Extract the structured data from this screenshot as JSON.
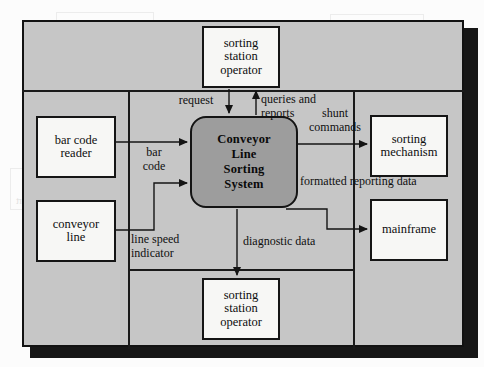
{
  "figure": {
    "type": "context-diagram",
    "process": {
      "id": "0",
      "label": "Conveyor\nLine\nSorting\nSystem",
      "shape": "rounded-rectangle",
      "fill": "#9d9d9d"
    },
    "entities": [
      {
        "key": "operator_top",
        "label": "sorting\nstation\noperator",
        "position": "top"
      },
      {
        "key": "bar_code_reader",
        "label": "bar code\nreader",
        "position": "left-upper"
      },
      {
        "key": "conveyor_line",
        "label": "conveyor\nline",
        "position": "left-lower"
      },
      {
        "key": "sorting_mechanism",
        "label": "sorting\nmechanism",
        "position": "right-upper"
      },
      {
        "key": "mainframe",
        "label": "mainframe",
        "position": "right-lower"
      },
      {
        "key": "operator_bottom",
        "label": "sorting\nstation\noperator",
        "position": "bottom"
      }
    ],
    "flows": [
      {
        "key": "request",
        "label": "request",
        "from": "operator_top",
        "to": "process",
        "direction": "down"
      },
      {
        "key": "queries",
        "label": "queries and\nreports",
        "from": "process",
        "to": "operator_top",
        "direction": "up"
      },
      {
        "key": "shunt",
        "label": "shunt\ncommands",
        "from": "process",
        "to": "sorting_mechanism",
        "direction": "right"
      },
      {
        "key": "barcode",
        "label": "bar\ncode",
        "from": "bar_code_reader",
        "to": "process",
        "direction": "right"
      },
      {
        "key": "linespeed",
        "label": "line speed\nindicator",
        "from": "conveyor_line",
        "to": "process",
        "direction": "right"
      },
      {
        "key": "formatted",
        "label": "formatted reporting data",
        "from": "process",
        "to": "mainframe",
        "direction": "right"
      },
      {
        "key": "diagnostic",
        "label": "diagnostic data",
        "from": "process",
        "to": "operator_bottom",
        "direction": "down"
      }
    ],
    "colors": {
      "frame_fill": "#c6c6c6",
      "entity_fill": "#f7f7f5",
      "process_fill": "#9d9d9d",
      "ink": "#121212"
    }
  },
  "bleed": {
    "fragments": [
      "operator",
      "interface",
      "procedure",
      "diagnostic media",
      "request",
      "line\nspeed",
      "bar code",
      "report",
      "error data",
      "formatted",
      "notification",
      "reporting"
    ]
  }
}
